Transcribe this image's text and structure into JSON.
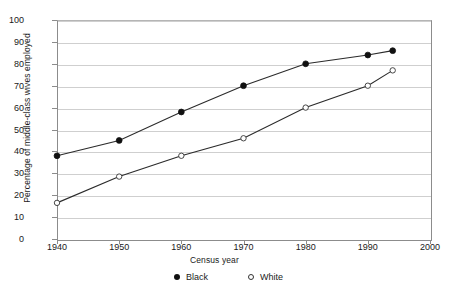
{
  "chart_data": {
    "type": "line",
    "title": "",
    "xlabel": "Census year",
    "ylabel": "Percentage of middle-class wives employed",
    "xlim": [
      1940,
      2000
    ],
    "ylim": [
      0,
      100
    ],
    "xticks": [
      1940,
      1950,
      1960,
      1970,
      1980,
      1990,
      2000
    ],
    "yticks": [
      0,
      10,
      20,
      30,
      40,
      50,
      60,
      70,
      80,
      90,
      100
    ],
    "grid": "horizontal",
    "legend_position": "bottom-center",
    "series": [
      {
        "name": "Black",
        "marker": "filled-circle",
        "color": "#111111",
        "x": [
          1940,
          1950,
          1960,
          1970,
          1980,
          1990,
          1994
        ],
        "values": [
          38,
          45,
          58,
          70,
          80,
          84,
          86
        ]
      },
      {
        "name": "White",
        "marker": "open-circle",
        "color": "#333333",
        "x": [
          1940,
          1950,
          1960,
          1970,
          1980,
          1990,
          1994
        ],
        "values": [
          16.5,
          28.5,
          38,
          46,
          60,
          70,
          77
        ]
      }
    ]
  },
  "legend": {
    "items": [
      {
        "label": "Black",
        "marker": "filled-circle"
      },
      {
        "label": "White",
        "marker": "open-circle"
      }
    ]
  },
  "colors": {
    "gridline": "#cfcfcf",
    "axis": "#8c8c8c",
    "line": "#2b2b2b",
    "text": "#1a1a1a",
    "background": "#ffffff"
  }
}
